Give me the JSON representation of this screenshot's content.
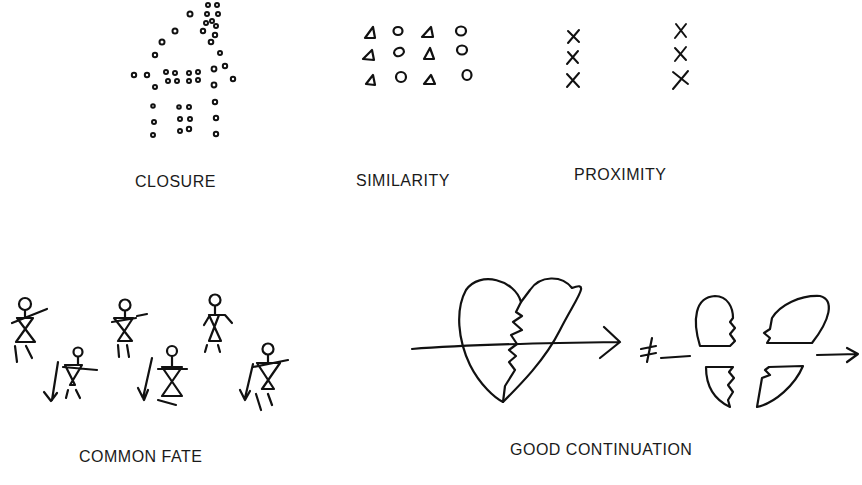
{
  "diagram": {
    "panels": [
      {
        "id": "closure",
        "label": "CLOSURE",
        "icon": "dotted-house-icon"
      },
      {
        "id": "similarity",
        "label": "SIMILARITY",
        "icon": "triangles-circles-grid-icon"
      },
      {
        "id": "proximity",
        "label": "PROXIMITY",
        "icon": "x-columns-icon"
      },
      {
        "id": "common_fate",
        "label": "COMMON FATE",
        "icon": "stick-figures-icon"
      },
      {
        "id": "good_continuation",
        "label": "GOOD CONTINUATION",
        "icon": "broken-heart-arrow-icon"
      }
    ],
    "symbols": {
      "not_equal": "≠"
    },
    "colors": {
      "ink": "#111111",
      "background": "#ffffff"
    }
  }
}
